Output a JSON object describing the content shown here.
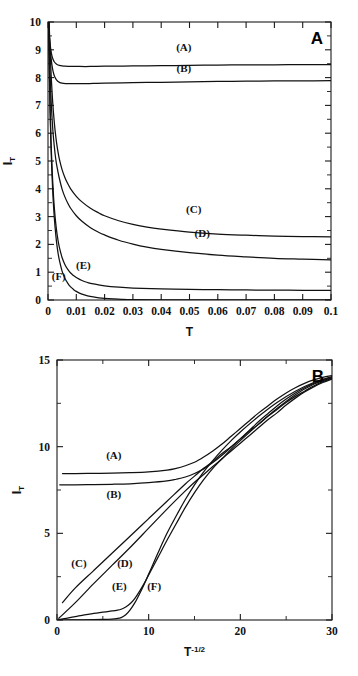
{
  "figure": {
    "background": "#ffffff",
    "curve_color": "#111111",
    "axis_color": "#1a1a1a"
  },
  "chart_data": [
    {
      "type": "line",
      "panel_letter": "A",
      "title": "",
      "xlabel": "T",
      "ylabel": "I_T",
      "ylabel_base": "I",
      "ylabel_sub": "T",
      "xlim": [
        0,
        0.1
      ],
      "ylim": [
        0,
        10
      ],
      "xticks": [
        0,
        0.01,
        0.02,
        0.03,
        0.04,
        0.05,
        0.06,
        0.07,
        0.08,
        0.09,
        0.1
      ],
      "xticklabels": [
        "0",
        "0.01",
        "0.02",
        "0.03",
        "0.04",
        "0.05",
        "0.06",
        "0.07",
        "0.08",
        "0.09",
        "0.1"
      ],
      "yticks": [
        0,
        1,
        2,
        3,
        4,
        5,
        6,
        7,
        8,
        9,
        10
      ],
      "yticklabels": [
        "0",
        "1",
        "2",
        "3",
        "4",
        "5",
        "6",
        "7",
        "8",
        "9",
        "10"
      ],
      "yminor": [
        0.5,
        1.5,
        2.5,
        3.5,
        4.5,
        5.5,
        6.5,
        7.5,
        8.5,
        9.5
      ],
      "grid": false,
      "legend": "inline-curve-labels",
      "series": [
        {
          "name": "(A)",
          "label_x": 0.048,
          "label_y": 8.95,
          "x": [
            0.0002,
            0.0004,
            0.0007,
            0.001,
            0.0014,
            0.0018,
            0.0022,
            0.0027,
            0.0032,
            0.004,
            0.005,
            0.006,
            0.008,
            0.01,
            0.015,
            0.02,
            0.03,
            0.04,
            0.05,
            0.06,
            0.07,
            0.08,
            0.09,
            0.1
          ],
          "y": [
            10.0,
            9.62,
            9.25,
            9.0,
            8.78,
            8.65,
            8.57,
            8.51,
            8.47,
            8.44,
            8.42,
            8.41,
            8.4,
            8.4,
            8.4,
            8.41,
            8.42,
            8.43,
            8.44,
            8.45,
            8.46,
            8.46,
            8.47,
            8.47
          ]
        },
        {
          "name": "(B)",
          "label_x": 0.048,
          "label_y": 8.2,
          "x": [
            0.0002,
            0.0005,
            0.0008,
            0.0012,
            0.0016,
            0.002,
            0.0025,
            0.003,
            0.0037,
            0.0045,
            0.0055,
            0.007,
            0.009,
            0.012,
            0.016,
            0.02,
            0.03,
            0.04,
            0.05,
            0.06,
            0.07,
            0.08,
            0.09,
            0.1
          ],
          "y": [
            10.0,
            9.45,
            9.0,
            8.6,
            8.32,
            8.14,
            8.0,
            7.92,
            7.85,
            7.81,
            7.79,
            7.78,
            7.78,
            7.78,
            7.79,
            7.8,
            7.82,
            7.83,
            7.85,
            7.86,
            7.87,
            7.88,
            7.88,
            7.89
          ]
        },
        {
          "name": "(C)",
          "label_x": 0.0515,
          "label_y": 3.12,
          "x": [
            0.0004,
            0.0008,
            0.0012,
            0.0016,
            0.002,
            0.0025,
            0.003,
            0.0035,
            0.004,
            0.005,
            0.006,
            0.007,
            0.008,
            0.01,
            0.012,
            0.015,
            0.018,
            0.02,
            0.025,
            0.03,
            0.035,
            0.04,
            0.05,
            0.06,
            0.07,
            0.08,
            0.09,
            0.1
          ],
          "y": [
            10.0,
            8.8,
            7.9,
            7.2,
            6.65,
            6.1,
            5.68,
            5.35,
            5.08,
            4.68,
            4.4,
            4.18,
            4.0,
            3.73,
            3.53,
            3.3,
            3.13,
            3.03,
            2.85,
            2.72,
            2.62,
            2.55,
            2.44,
            2.37,
            2.33,
            2.3,
            2.28,
            2.27
          ]
        },
        {
          "name": "(D)",
          "label_x": 0.0545,
          "label_y": 2.28,
          "x": [
            0.0003,
            0.0006,
            0.001,
            0.0014,
            0.0018,
            0.0022,
            0.0027,
            0.0032,
            0.004,
            0.005,
            0.006,
            0.007,
            0.008,
            0.01,
            0.012,
            0.015,
            0.018,
            0.02,
            0.025,
            0.03,
            0.035,
            0.04,
            0.05,
            0.06,
            0.07,
            0.08,
            0.09,
            0.1
          ],
          "y": [
            10.0,
            8.55,
            7.4,
            6.6,
            6.0,
            5.55,
            5.1,
            4.78,
            4.38,
            3.98,
            3.7,
            3.48,
            3.3,
            3.03,
            2.83,
            2.6,
            2.43,
            2.34,
            2.15,
            2.01,
            1.9,
            1.82,
            1.7,
            1.61,
            1.55,
            1.5,
            1.47,
            1.44
          ]
        },
        {
          "name": "(E)",
          "label_x": 0.0125,
          "label_y": 1.12,
          "x": [
            0.0002,
            0.0005,
            0.0008,
            0.0011,
            0.0015,
            0.002,
            0.0025,
            0.003,
            0.0035,
            0.004,
            0.005,
            0.006,
            0.007,
            0.008,
            0.009,
            0.01,
            0.012,
            0.014,
            0.016,
            0.02,
            0.025,
            0.03,
            0.04,
            0.05,
            0.06,
            0.07,
            0.08,
            0.09,
            0.1
          ],
          "y": [
            10.0,
            8.2,
            6.7,
            5.6,
            4.6,
            3.65,
            3.0,
            2.52,
            2.17,
            1.9,
            1.52,
            1.27,
            1.1,
            0.97,
            0.88,
            0.81,
            0.7,
            0.63,
            0.58,
            0.51,
            0.46,
            0.43,
            0.4,
            0.38,
            0.37,
            0.36,
            0.355,
            0.35,
            0.35
          ]
        },
        {
          "name": "(F)",
          "label_x": 0.0038,
          "label_y": 0.72,
          "x": [
            0.0002,
            0.0004,
            0.0007,
            0.001,
            0.0013,
            0.0017,
            0.0021,
            0.0025,
            0.003,
            0.0035,
            0.004,
            0.005,
            0.006,
            0.007,
            0.008,
            0.009,
            0.01,
            0.012,
            0.014,
            0.016,
            0.018,
            0.02,
            0.023,
            0.026,
            0.03,
            0.04,
            0.06,
            0.08,
            0.1
          ],
          "y": [
            10.0,
            8.7,
            7.0,
            5.75,
            4.8,
            3.85,
            3.15,
            2.62,
            2.1,
            1.72,
            1.44,
            1.03,
            0.77,
            0.6,
            0.47,
            0.38,
            0.31,
            0.21,
            0.15,
            0.11,
            0.08,
            0.06,
            0.04,
            0.025,
            0.015,
            0.008,
            0.004,
            0.002,
            0.001
          ]
        }
      ]
    },
    {
      "type": "line",
      "panel_letter": "B",
      "title": "",
      "xlabel": "T-1/2",
      "xlabel_base": "T",
      "xlabel_sup": "-1/2",
      "ylabel": "I_T",
      "ylabel_base": "I",
      "ylabel_sub": "T",
      "xlim": [
        0,
        30
      ],
      "ylim": [
        0,
        15
      ],
      "xticks": [
        0,
        10,
        20,
        30
      ],
      "xticklabels": [
        "0",
        "10",
        "20",
        "30"
      ],
      "xminor": [
        5,
        15,
        25
      ],
      "yticks": [
        0,
        5,
        10,
        15
      ],
      "yticklabels": [
        "0",
        "5",
        "10",
        "15"
      ],
      "yminor": [
        2.5,
        7.5,
        12.5
      ],
      "grid": false,
      "legend": "inline-curve-labels",
      "series": [
        {
          "name": "(A)",
          "label_x": 6.2,
          "label_y": 9.3,
          "x": [
            0.6,
            2,
            4,
            6,
            8,
            10,
            12,
            13,
            14,
            15,
            16,
            17,
            18,
            19,
            20,
            21,
            22,
            23,
            24,
            25,
            26,
            27,
            28,
            29,
            30
          ],
          "y": [
            8.45,
            8.45,
            8.46,
            8.47,
            8.5,
            8.55,
            8.65,
            8.75,
            8.9,
            9.1,
            9.4,
            9.75,
            10.15,
            10.6,
            11.05,
            11.5,
            11.95,
            12.35,
            12.75,
            13.1,
            13.4,
            13.65,
            13.85,
            14.0,
            14.1
          ]
        },
        {
          "name": "(B)",
          "label_x": 6.2,
          "label_y": 7.05,
          "x": [
            0.3,
            2,
            4,
            6,
            8,
            10,
            12,
            13,
            14,
            15,
            16,
            17,
            18,
            19,
            20,
            21,
            22,
            23,
            24,
            25,
            26,
            27,
            28,
            29,
            30
          ],
          "y": [
            7.8,
            7.8,
            7.81,
            7.83,
            7.86,
            7.92,
            8.02,
            8.12,
            8.25,
            8.45,
            8.72,
            9.08,
            9.5,
            9.98,
            10.45,
            10.95,
            11.45,
            11.9,
            12.35,
            12.75,
            13.1,
            13.4,
            13.65,
            13.85,
            14.0
          ]
        },
        {
          "name": "(C)",
          "label_x": 2.4,
          "label_y": 3.05,
          "x": [
            0.6,
            2,
            4,
            6,
            8,
            10,
            12,
            14,
            15,
            16,
            17,
            18,
            19,
            20,
            21,
            22,
            23,
            24,
            25,
            26,
            27,
            28,
            29,
            30
          ],
          "y": [
            1.0,
            1.85,
            2.85,
            3.85,
            4.85,
            5.85,
            6.85,
            7.85,
            8.3,
            8.75,
            9.15,
            9.6,
            10.0,
            10.45,
            10.9,
            11.3,
            11.75,
            12.15,
            12.55,
            12.9,
            13.2,
            13.5,
            13.75,
            13.95
          ]
        },
        {
          "name": "(D)",
          "label_x": 7.4,
          "label_y": 3.05,
          "x": [
            0.2,
            2,
            4,
            6,
            8,
            10,
            12,
            14,
            15,
            16,
            17,
            18,
            19,
            20,
            21,
            22,
            23,
            24,
            25,
            26,
            27,
            28,
            29,
            30
          ],
          "y": [
            0.1,
            1.0,
            2.1,
            3.15,
            4.2,
            5.3,
            6.4,
            7.45,
            7.95,
            8.4,
            8.85,
            9.3,
            9.75,
            10.2,
            10.65,
            11.1,
            11.55,
            11.95,
            12.4,
            12.8,
            13.15,
            13.45,
            13.7,
            13.9
          ]
        },
        {
          "name": "(E)",
          "label_x": 6.8,
          "label_y": 1.75,
          "x": [
            0.2,
            1,
            2,
            3,
            4,
            5,
            6,
            6.5,
            7,
            7.5,
            8,
            8.5,
            9,
            9.5,
            10,
            11,
            12,
            13,
            14,
            15,
            16,
            17,
            18,
            19,
            20,
            22,
            24,
            26,
            28,
            30
          ],
          "y": [
            0.02,
            0.1,
            0.2,
            0.3,
            0.38,
            0.45,
            0.52,
            0.56,
            0.62,
            0.75,
            0.95,
            1.25,
            1.65,
            2.1,
            2.6,
            3.6,
            4.6,
            5.55,
            6.5,
            7.35,
            8.1,
            8.75,
            9.3,
            9.85,
            10.35,
            11.3,
            12.2,
            13.0,
            13.6,
            14.0
          ]
        },
        {
          "name": "(F)",
          "label_x": 10.6,
          "label_y": 1.75,
          "x": [
            0.2,
            2,
            4,
            5,
            6,
            6.5,
            7,
            7.5,
            8,
            8.5,
            9,
            9.5,
            10,
            10.5,
            11,
            12,
            13,
            14,
            15,
            16,
            17,
            18,
            19,
            20,
            22,
            24,
            26,
            28,
            30
          ],
          "y": [
            0.0,
            0.01,
            0.02,
            0.03,
            0.05,
            0.08,
            0.14,
            0.3,
            0.6,
            1.0,
            1.5,
            2.05,
            2.65,
            3.25,
            3.85,
            5.0,
            6.0,
            6.95,
            7.8,
            8.55,
            9.2,
            9.8,
            10.35,
            10.85,
            11.75,
            12.55,
            13.2,
            13.7,
            14.05
          ]
        }
      ]
    }
  ]
}
